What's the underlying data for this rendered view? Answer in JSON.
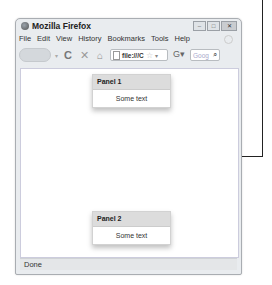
{
  "window": {
    "title": "Mozilla Firefox",
    "buttons": [
      "minimize",
      "maximize",
      "close"
    ]
  },
  "menubar": {
    "items": [
      {
        "label": "File",
        "accel": "F"
      },
      {
        "label": "Edit",
        "accel": "E"
      },
      {
        "label": "View",
        "accel": "V"
      },
      {
        "label": "History",
        "accel": ""
      },
      {
        "label": "Bookmarks",
        "accel": "B"
      },
      {
        "label": "Tools",
        "accel": "T"
      },
      {
        "label": "Help",
        "accel": "H"
      }
    ]
  },
  "navbar": {
    "url": "file:///C",
    "search_placeholder": "Goog"
  },
  "panels": [
    {
      "title": "Panel 1",
      "body": "Some text"
    },
    {
      "title": "Panel 2",
      "body": "Some text"
    }
  ],
  "status": {
    "text": "Done"
  }
}
